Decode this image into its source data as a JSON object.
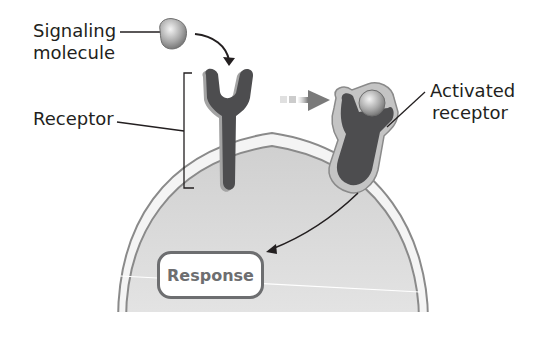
{
  "diagram": {
    "labels": {
      "signaling_molecule_line1": "Signaling",
      "signaling_molecule_line2": "molecule",
      "receptor": "Receptor",
      "activated_receptor_line1": "Activated",
      "activated_receptor_line2": "receptor",
      "response": "Response"
    },
    "colors": {
      "cytoplasm": "#d9d9d9",
      "membrane_outline": "#8a8a8a",
      "membrane_fill": "#f2f2f2",
      "receptor_body": "#4d4d4f",
      "receptor_shadow": "#9a9a9a",
      "activated_halo": "#bdbdbd",
      "molecule": "#b3b3b3",
      "arrow": "#231f20",
      "response_border": "#6d6e70",
      "label_text": "#231f20"
    }
  }
}
